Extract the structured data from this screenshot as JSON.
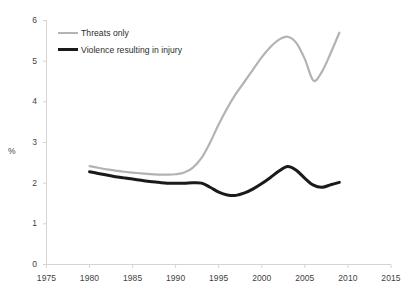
{
  "chart_data": {
    "type": "line",
    "title": "",
    "subtitle": "",
    "xlabel": "",
    "ylabel": "%",
    "xlim": [
      1975,
      2015
    ],
    "ylim": [
      0,
      6
    ],
    "xticks": [
      "1975",
      "1980",
      "1985",
      "1990",
      "1995",
      "2000",
      "2005",
      "2010",
      "2015"
    ],
    "yticks": [
      "0",
      "1",
      "2",
      "3",
      "4",
      "5",
      "6"
    ],
    "grid": false,
    "legend_position": "top-left",
    "x": [
      1980,
      1981,
      1982,
      1983,
      1984,
      1985,
      1986,
      1987,
      1988,
      1989,
      1990,
      1991,
      1992,
      1993,
      1994,
      1995,
      1996,
      1997,
      1998,
      1999,
      2000,
      2001,
      2002,
      2003,
      2004,
      2005,
      2006,
      2007,
      2008,
      2009
    ],
    "series": [
      {
        "name": "Threats only",
        "color": "#b3b3b3",
        "values": [
          2.42,
          2.38,
          2.34,
          2.31,
          2.28,
          2.26,
          2.24,
          2.22,
          2.21,
          2.21,
          2.22,
          2.26,
          2.38,
          2.62,
          3.0,
          3.45,
          3.85,
          4.2,
          4.5,
          4.8,
          5.1,
          5.35,
          5.53,
          5.6,
          5.45,
          5.05,
          4.52,
          4.75,
          5.2,
          5.7
        ]
      },
      {
        "name": "Violence resulting in injury",
        "color": "#1a1a1a",
        "values": [
          2.28,
          2.24,
          2.2,
          2.16,
          2.13,
          2.1,
          2.07,
          2.04,
          2.02,
          2.0,
          2.0,
          2.0,
          2.01,
          2.0,
          1.9,
          1.78,
          1.71,
          1.7,
          1.76,
          1.86,
          1.99,
          2.14,
          2.3,
          2.41,
          2.32,
          2.12,
          1.95,
          1.9,
          1.96,
          2.02
        ]
      }
    ]
  }
}
